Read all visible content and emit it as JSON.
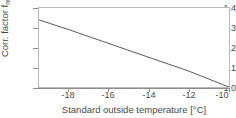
{
  "chart_data": {
    "type": "line",
    "title": "",
    "xlabel": "Standard outside temperature [°C]",
    "ylabel_main": "Corr. factor f",
    "ylabel_sub": "norm",
    "ylabel_unit": " [-]",
    "ylabel_full": "Corr. factor f norm [-]",
    "xlim": [
      -19.5,
      -10.0
    ],
    "ylim": [
      1.0,
      1.4
    ],
    "xticks": [
      -18,
      -16,
      -14,
      -12,
      -10
    ],
    "xtick_labels": [
      "-18",
      "-16",
      "-14",
      "-12",
      "-10"
    ],
    "yticks": [
      1.0,
      1.1,
      1.2,
      1.3,
      1.4
    ],
    "ytick_labels": [
      "1.0",
      "1.1",
      "1.2",
      "1.3",
      "1.4"
    ],
    "grid": false,
    "legend": null,
    "series": [
      {
        "name": "correction factor",
        "color": "#5a5a5a",
        "x": [
          -19.5,
          -18.0,
          -16.0,
          -14.0,
          -12.0,
          -10.0
        ],
        "values": [
          1.34,
          1.29,
          1.22,
          1.15,
          1.08,
          1.0
        ]
      }
    ]
  },
  "style": {
    "line_color": "#5a5a5a",
    "frame_color": "#b9b9b9",
    "axis_color": "#8d8d8d",
    "text_color": "#4a4a4a",
    "background": "#ffffff"
  }
}
